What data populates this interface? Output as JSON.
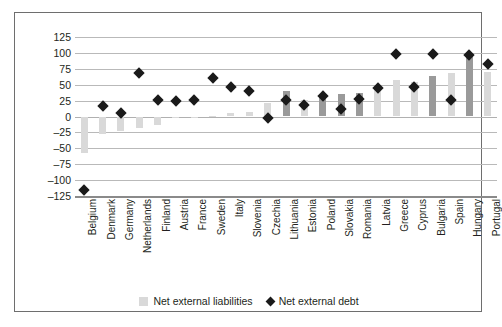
{
  "chart_data": {
    "type": "bar",
    "title": "",
    "subtitle": "",
    "xlabel": "",
    "ylabel": "",
    "ylim": [
      -125,
      125
    ],
    "ytick_values": [
      125,
      100,
      75,
      50,
      25,
      0,
      -25,
      -50,
      -75,
      -100,
      -125
    ],
    "ytick_labels": [
      "125",
      "100",
      "75",
      "50",
      "25",
      "0",
      "–25",
      "–50",
      "–75",
      "–100",
      "–125"
    ],
    "grid": true,
    "legend_position": "bottom-center",
    "categories": [
      "Belgium",
      "Denmark",
      "Germany",
      "Netherlands",
      "Finland",
      "Austria",
      "France",
      "Sweden",
      "Italy",
      "Slovenia",
      "Czechia",
      "Lithuania",
      "Estonia",
      "Poland",
      "Slovakia",
      "Romania",
      "Latvia",
      "Greece",
      "Cyprus",
      "Bulgaria",
      "Spain",
      "Hungary",
      "Portugal"
    ],
    "series": [
      {
        "name": "Net external liabilities",
        "type": "bar",
        "color": "#d9d9d9",
        "values": [
          -58,
          -27,
          -23,
          -18,
          -13,
          -3,
          -2,
          1,
          6,
          7,
          22,
          40,
          26,
          34,
          35,
          37,
          43,
          57,
          55,
          63,
          68,
          98,
          70
        ]
      },
      {
        "name": "Net external debt",
        "type": "scatter",
        "marker": "diamond",
        "color": "#1a1a1a",
        "values": [
          -115,
          16,
          6,
          68,
          26,
          24,
          26,
          61,
          47,
          40,
          -3,
          26,
          18,
          33,
          12,
          28,
          45,
          98,
          47,
          98,
          26,
          97,
          83
        ]
      }
    ],
    "bar_shades": [
      "light",
      "light",
      "light",
      "light",
      "light",
      "light",
      "light",
      "light",
      "light",
      "light",
      "light",
      "dark",
      "light",
      "dark",
      "dark",
      "dark",
      "light",
      "light",
      "light",
      "dark",
      "light",
      "dark",
      "light"
    ]
  },
  "legend": {
    "items": [
      {
        "label": "Net external liabilities",
        "glyph": "square-swatch"
      },
      {
        "label": "Net external debt",
        "glyph": "diamond-marker"
      }
    ]
  }
}
